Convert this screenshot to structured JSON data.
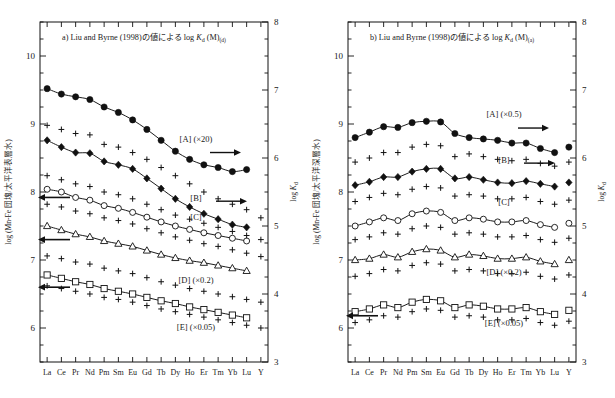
{
  "figure": {
    "background": "#ffffff",
    "ink": "#111111",
    "panels": [
      {
        "id": "a",
        "title_parts": {
          "prefix": "a)",
          "cite": "Liu and Byrne",
          "year": "(1998)",
          "jp": "の値による",
          "log": "log",
          "k": "K",
          "ksub": "d",
          "m": "(M)",
          "msub": "(d)"
        },
        "title_full": "a) Liu and Byrne (1998) の値による log Kd (M)(d)",
        "y_left_label": "log (Mn-Fe 団塊/太平洋表層水)",
        "y_right_label": "log Kd",
        "y_left": {
          "min": 5.5,
          "max": 10.5,
          "ticks": [
            10,
            9,
            8,
            7,
            6
          ],
          "minor_step": 0.25
        },
        "y_right": {
          "min": 3.0,
          "max": 8.0,
          "ticks": [
            8,
            7,
            6,
            5,
            4,
            3
          ],
          "minor_step": 0.25
        },
        "series_labels": [
          {
            "name": "[A]",
            "scale": "(×20)",
            "arrow": "right"
          },
          {
            "name": "[B]",
            "scale": "",
            "arrow": "right"
          },
          {
            "name": "[C]",
            "scale": "",
            "arrow": ""
          },
          {
            "name": "[D]",
            "scale": "(×0.2)",
            "arrow": "left"
          },
          {
            "name": "[E]",
            "scale": "(×0.05)",
            "arrow": "left"
          }
        ]
      },
      {
        "id": "b",
        "title_parts": {
          "prefix": "b)",
          "cite": "Liu and Byrne",
          "year": "(1998)",
          "jp": "の値による",
          "log": "log",
          "k": "K",
          "ksub": "d",
          "m": "(M)",
          "msub": "(a)"
        },
        "title_full": "b) Liu and Byrne (1998) の値による log Kd (M)(a)",
        "y_left_label": "log (Mn-Fe 団塊/太平洋深層水)",
        "y_right_label": "log Kd",
        "y_left": {
          "min": 5.5,
          "max": 10.5,
          "ticks": [
            10,
            9,
            8,
            7,
            6
          ],
          "minor_step": 0.25
        },
        "y_right": {
          "min": 3.0,
          "max": 8.0,
          "ticks": [
            8,
            7,
            6,
            5,
            4,
            3
          ],
          "minor_step": 0.25
        },
        "series_labels": [
          {
            "name": "[A]",
            "scale": "(×0.5)",
            "arrow": "right"
          },
          {
            "name": "[B]",
            "scale": "",
            "arrow": "right"
          },
          {
            "name": "[C]",
            "scale": "",
            "arrow": ""
          },
          {
            "name": "[D]",
            "scale": "(×0.2)",
            "arrow": "left"
          },
          {
            "name": "[E]",
            "scale": "(×0.05)",
            "arrow": "left"
          }
        ]
      }
    ]
  },
  "chart_data": [
    {
      "type": "line",
      "panel": "a",
      "title": "a) Liu and Byrne (1998) の値による log Kd (M)(d)",
      "xlabel": "",
      "ylabel": "log (Mn-Fe 団塊/太平洋表層水)",
      "ylabel_right": "log Kd",
      "categories": [
        "La",
        "Ce",
        "Pr",
        "Nd",
        "Pm",
        "Sm",
        "Eu",
        "Gd",
        "Tb",
        "Dy",
        "Ho",
        "Er",
        "Tm",
        "Yb",
        "Lu",
        "Y"
      ],
      "ylim": [
        5.5,
        10.5
      ],
      "ylim_right": [
        3.0,
        8.0
      ],
      "grid": false,
      "legend": "inside-right",
      "series": [
        {
          "name": "[A]",
          "marker": "filled-circle",
          "connected": true,
          "scale": "×20",
          "values": [
            9.52,
            9.44,
            9.4,
            9.36,
            9.25,
            9.17,
            9.06,
            8.92,
            8.76,
            8.6,
            8.48,
            8.4,
            8.36,
            8.3,
            8.33,
            null
          ]
        },
        {
          "name": "[B]",
          "marker": "filled-diamond",
          "connected": true,
          "scale": "",
          "values": [
            8.76,
            8.66,
            8.58,
            8.57,
            8.45,
            8.4,
            8.34,
            8.2,
            8.05,
            7.9,
            7.78,
            7.68,
            7.6,
            7.52,
            7.48,
            null
          ]
        },
        {
          "name": "[C]",
          "marker": "open-circle",
          "connected": true,
          "scale": "",
          "values": [
            8.04,
            8.0,
            7.92,
            7.88,
            7.8,
            7.76,
            7.7,
            7.63,
            7.56,
            7.5,
            7.45,
            7.4,
            7.36,
            7.32,
            7.28,
            null
          ]
        },
        {
          "name": "[D]",
          "marker": "open-triangle",
          "connected": true,
          "scale": "×0.2",
          "values": [
            7.5,
            7.44,
            7.38,
            7.34,
            7.28,
            7.24,
            7.2,
            7.14,
            7.08,
            7.03,
            6.99,
            6.96,
            6.92,
            6.88,
            6.84,
            null
          ]
        },
        {
          "name": "[E]",
          "marker": "open-square",
          "connected": true,
          "scale": "×0.05",
          "values": [
            6.78,
            6.73,
            6.68,
            6.64,
            6.58,
            6.54,
            6.5,
            6.45,
            6.4,
            6.36,
            6.31,
            6.27,
            6.23,
            6.19,
            6.15,
            null
          ]
        },
        {
          "name": "plus-A",
          "marker": "plus",
          "connected": false,
          "scale": "",
          "values": [
            8.98,
            8.92,
            8.86,
            8.84,
            8.7,
            8.66,
            8.58,
            8.48,
            8.36,
            8.24,
            8.12,
            8.0,
            7.9,
            7.82,
            7.74,
            7.62
          ]
        },
        {
          "name": "plus-B",
          "marker": "plus",
          "connected": false,
          "scale": "",
          "values": [
            8.24,
            8.18,
            8.12,
            8.08,
            8.0,
            7.96,
            7.9,
            7.82,
            7.74,
            7.66,
            7.6,
            7.54,
            7.48,
            7.42,
            7.36,
            7.3
          ]
        },
        {
          "name": "plus-C",
          "marker": "plus",
          "connected": false,
          "scale": "",
          "values": [
            7.82,
            7.78,
            7.72,
            7.68,
            7.62,
            7.58,
            7.53,
            7.46,
            7.4,
            7.34,
            7.29,
            7.24,
            7.2,
            7.15,
            7.1,
            7.05
          ]
        },
        {
          "name": "plus-D",
          "marker": "plus",
          "connected": false,
          "scale": "",
          "values": [
            7.06,
            7.02,
            6.97,
            6.94,
            6.88,
            6.84,
            6.8,
            6.74,
            6.68,
            6.63,
            6.58,
            6.54,
            6.5,
            6.46,
            6.42,
            6.38
          ]
        },
        {
          "name": "plus-E",
          "marker": "plus",
          "connected": false,
          "scale": "",
          "values": [
            6.62,
            6.58,
            6.54,
            6.5,
            6.45,
            6.42,
            6.38,
            6.33,
            6.28,
            6.24,
            6.2,
            6.16,
            6.12,
            6.08,
            6.04,
            6.0
          ]
        }
      ],
      "y_offset_markers": [
        {
          "name": "left-arrow-C",
          "y": 7.92
        },
        {
          "name": "left-arrow-D",
          "y": 7.3
        },
        {
          "name": "left-arrow-E",
          "y": 6.6
        }
      ]
    },
    {
      "type": "line",
      "panel": "b",
      "title": "b) Liu and Byrne (1998) の値による log Kd (M)(a)",
      "xlabel": "",
      "ylabel": "log (Mn-Fe 団塊/太平洋深層水)",
      "ylabel_right": "log Kd",
      "categories": [
        "La",
        "Ce",
        "Pr",
        "Nd",
        "Pm",
        "Sm",
        "Eu",
        "Gd",
        "Tb",
        "Dy",
        "Ho",
        "Er",
        "Tm",
        "Yb",
        "Lu",
        "Y"
      ],
      "ylim": [
        5.5,
        10.5
      ],
      "ylim_right": [
        3.0,
        8.0
      ],
      "grid": false,
      "legend": "inside-right",
      "series": [
        {
          "name": "[A]",
          "marker": "filled-circle",
          "connected": true,
          "scale": "×0.5",
          "values": [
            8.8,
            8.88,
            8.96,
            8.95,
            9.02,
            9.04,
            9.03,
            8.86,
            8.8,
            8.78,
            8.76,
            8.72,
            8.72,
            8.64,
            8.58,
            8.66
          ]
        },
        {
          "name": "[B]",
          "marker": "filled-diamond",
          "connected": true,
          "scale": "",
          "values": [
            8.1,
            8.15,
            8.22,
            8.22,
            8.3,
            8.34,
            8.34,
            8.2,
            8.22,
            8.18,
            8.14,
            8.13,
            8.16,
            8.12,
            8.08,
            8.14
          ]
        },
        {
          "name": "[C]",
          "marker": "open-circle",
          "connected": true,
          "scale": "",
          "values": [
            7.5,
            7.56,
            7.62,
            7.58,
            7.68,
            7.72,
            7.7,
            7.58,
            7.62,
            7.6,
            7.56,
            7.56,
            7.58,
            7.52,
            7.48,
            7.54
          ]
        },
        {
          "name": "[D]",
          "marker": "open-triangle",
          "connected": true,
          "scale": "×0.2",
          "values": [
            7.0,
            7.02,
            7.08,
            7.04,
            7.12,
            7.16,
            7.14,
            7.04,
            7.08,
            7.06,
            7.02,
            7.02,
            7.04,
            6.98,
            6.94,
            7.0
          ]
        },
        {
          "name": "[E]",
          "marker": "open-square",
          "connected": true,
          "scale": "×0.05",
          "values": [
            6.24,
            6.28,
            6.34,
            6.3,
            6.38,
            6.42,
            6.4,
            6.3,
            6.34,
            6.32,
            6.28,
            6.28,
            6.3,
            6.24,
            6.2,
            6.26
          ]
        },
        {
          "name": "plus-A",
          "marker": "plus",
          "connected": false,
          "scale": "",
          "values": [
            8.44,
            8.5,
            8.58,
            8.58,
            8.66,
            8.7,
            8.68,
            8.52,
            8.56,
            8.52,
            8.48,
            8.46,
            8.48,
            8.42,
            8.38,
            8.44
          ]
        },
        {
          "name": "plus-B",
          "marker": "plus",
          "connected": false,
          "scale": "",
          "values": [
            7.86,
            7.92,
            7.98,
            7.96,
            8.04,
            8.08,
            8.06,
            7.94,
            7.96,
            7.94,
            7.9,
            7.9,
            7.92,
            7.86,
            7.82,
            7.88
          ]
        },
        {
          "name": "plus-C",
          "marker": "plus",
          "connected": false,
          "scale": "",
          "values": [
            7.3,
            7.34,
            7.4,
            7.38,
            7.46,
            7.5,
            7.48,
            7.38,
            7.4,
            7.38,
            7.34,
            7.34,
            7.36,
            7.3,
            7.26,
            7.32
          ]
        },
        {
          "name": "plus-D",
          "marker": "plus",
          "connected": false,
          "scale": "",
          "values": [
            6.76,
            6.8,
            6.86,
            6.84,
            6.92,
            6.96,
            6.94,
            6.84,
            6.86,
            6.84,
            6.8,
            6.8,
            6.82,
            6.76,
            6.72,
            6.78
          ]
        },
        {
          "name": "plus-E",
          "marker": "plus",
          "connected": false,
          "scale": "",
          "values": [
            6.08,
            6.12,
            6.18,
            6.16,
            6.24,
            6.28,
            6.26,
            6.16,
            6.18,
            6.16,
            6.12,
            6.12,
            6.14,
            6.08,
            6.04,
            6.1
          ]
        }
      ],
      "y_offset_markers": [
        {
          "name": "left-arrow-E",
          "y": 6.18
        }
      ]
    }
  ]
}
